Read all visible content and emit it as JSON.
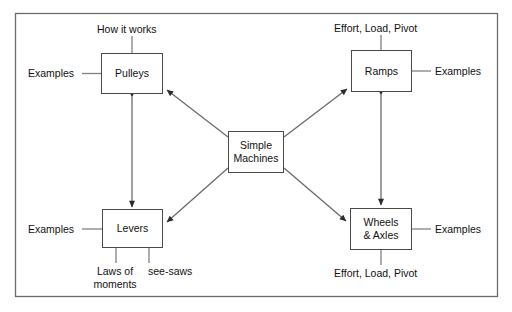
{
  "diagram": {
    "frame": {
      "stroke": "#6b6b6b"
    },
    "colors": {
      "box_border": "#4a4a4a",
      "connector": "#6b6b6b",
      "text": "#111111",
      "background": "#ffffff"
    },
    "nodes": {
      "center": {
        "line1": "Simple",
        "line2": "Machines"
      },
      "pulleys": {
        "line1": "Pulleys"
      },
      "ramps": {
        "line1": "Ramps"
      },
      "levers": {
        "line1": "Levers"
      },
      "wheels": {
        "line1": "Wheels",
        "line2": "& Axles"
      }
    },
    "labels": {
      "how_it_works": "How it works",
      "effort_load_pivot_top": "Effort, Load, Pivot",
      "examples_pulleys": "Examples",
      "examples_ramps": "Examples",
      "examples_levers": "Examples",
      "examples_wheels": "Examples",
      "laws_of_moments": "Laws of moments",
      "see_saws": "see-saws",
      "effort_load_pivot_bottom": "Effort, Load, Pivot"
    }
  }
}
